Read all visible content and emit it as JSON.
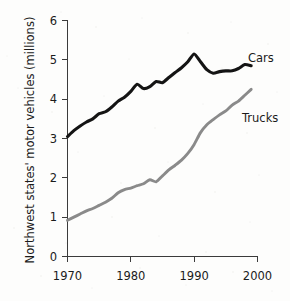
{
  "chart_data": {
    "type": "line",
    "title": "",
    "xlabel": "",
    "ylabel": "Northwest states' motor vehicles (millions)",
    "xlim": [
      1970,
      2000
    ],
    "ylim": [
      0,
      6
    ],
    "grid": false,
    "legend_position": "inline-right",
    "x_ticks": [
      "1970",
      "1980",
      "1990",
      "2000"
    ],
    "x_tick_values": [
      1970,
      1980,
      1990,
      2000
    ],
    "y_ticks": [
      "0",
      "1",
      "2",
      "3",
      "4",
      "5",
      "6"
    ],
    "y_tick_values": [
      0,
      1,
      2,
      3,
      4,
      5,
      6
    ],
    "x": [
      1970,
      1971,
      1972,
      1973,
      1974,
      1975,
      1976,
      1977,
      1978,
      1979,
      1980,
      1981,
      1982,
      1983,
      1984,
      1985,
      1986,
      1987,
      1988,
      1989,
      1990,
      1991,
      1992,
      1993,
      1994,
      1995,
      1996,
      1997,
      1998,
      1999
    ],
    "series": [
      {
        "name": "Cars",
        "color": "#141414",
        "values": [
          3.05,
          3.2,
          3.32,
          3.42,
          3.5,
          3.63,
          3.68,
          3.8,
          3.95,
          4.05,
          4.2,
          4.38,
          4.27,
          4.32,
          4.45,
          4.42,
          4.55,
          4.68,
          4.8,
          4.95,
          5.15,
          4.95,
          4.75,
          4.66,
          4.7,
          4.72,
          4.72,
          4.78,
          4.88,
          4.85
        ]
      },
      {
        "name": "Trucks",
        "color": "#8a8a8a",
        "values": [
          0.92,
          1.0,
          1.08,
          1.16,
          1.22,
          1.3,
          1.38,
          1.48,
          1.62,
          1.7,
          1.74,
          1.8,
          1.85,
          1.95,
          1.9,
          2.05,
          2.2,
          2.32,
          2.45,
          2.62,
          2.85,
          3.15,
          3.35,
          3.48,
          3.6,
          3.7,
          3.85,
          3.95,
          4.1,
          4.25
        ]
      }
    ],
    "annotations": [
      {
        "text": "Cars",
        "x": 2000.5,
        "y": 5.05
      },
      {
        "text": "Trucks",
        "x": 2000.0,
        "y": 3.5
      }
    ]
  }
}
